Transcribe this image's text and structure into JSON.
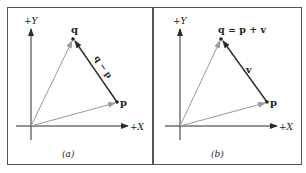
{
  "figure": {
    "colors": {
      "frame": "#555555",
      "axis": "#2a2a2a",
      "position_vector": "#9a9a9a",
      "difference_vector": "#2a2a2a",
      "text": "#222222"
    },
    "panels": [
      {
        "id": "a",
        "caption": "(a)",
        "y_axis_label": "+Y",
        "x_axis_label": "+X",
        "point_q_label": "q",
        "point_p_label": "p",
        "vector_label": "q − p"
      },
      {
        "id": "b",
        "caption": "(b)",
        "y_axis_label": "+Y",
        "x_axis_label": "+X",
        "point_q_label": "q = p + v",
        "point_p_label": "p",
        "vector_label": "v"
      }
    ]
  }
}
